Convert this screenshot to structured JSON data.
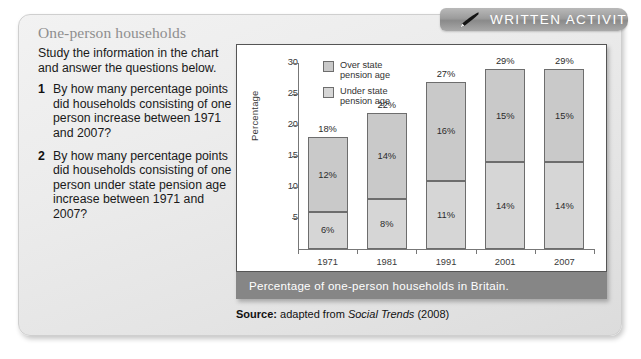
{
  "header": {
    "tab_label": "WRITTEN ACTIVITY",
    "icon": "pen-icon"
  },
  "panel": {
    "title": "One-person households",
    "intro": "Study the information in the chart and answer the questions below.",
    "questions": [
      {
        "number": "1",
        "text": "By how many percentage points did households consisting of one person increase between 1971 and 2007?"
      },
      {
        "number": "2",
        "text": "By how many percentage points did households consisting of one person under state pension age increase between 1971 and 2007?"
      }
    ]
  },
  "chart_caption": "Percentage of one-person households in Britain.",
  "source": {
    "prefix": "Source:",
    "text": " adapted from ",
    "italic": "Social Trends",
    "suffix": " (2008)"
  },
  "colors": {
    "over_segment": "#c9c9c9",
    "under_segment": "#d6d6d6",
    "segment_border": "#6d6d6d",
    "caption_bar": "#868686",
    "banner": "#9c9c9c",
    "panel_bg": "#ececec",
    "title_text": "#8e8e8e"
  },
  "chart_data": {
    "type": "bar",
    "stacked": true,
    "title": "",
    "xlabel": "",
    "ylabel": "Percentage",
    "categories": [
      "1971",
      "1981",
      "1991",
      "2001",
      "2007"
    ],
    "ylim": [
      0,
      30
    ],
    "yticks": [
      5,
      10,
      15,
      20,
      25,
      30
    ],
    "ytick_labels": [
      "5",
      "10",
      "15",
      "20",
      "25",
      "30"
    ],
    "grid": false,
    "legend_position": "top-left",
    "series": [
      {
        "name": "Under state pension age",
        "legend_label": "Under state\npension age",
        "color": "#d6d6d6",
        "values": [
          6,
          8,
          11,
          14,
          14
        ],
        "data_labels": [
          "6%",
          "8%",
          "11%",
          "14%",
          "14%"
        ]
      },
      {
        "name": "Over state pension age",
        "legend_label": "Over state\npension age",
        "color": "#c9c9c9",
        "values": [
          12,
          14,
          16,
          15,
          15
        ],
        "data_labels": [
          "12%",
          "14%",
          "16%",
          "15%",
          "15%"
        ]
      }
    ],
    "totals": [
      18,
      22,
      27,
      29,
      29
    ],
    "total_labels": [
      "18%",
      "22%",
      "27%",
      "29%",
      "29%"
    ]
  }
}
